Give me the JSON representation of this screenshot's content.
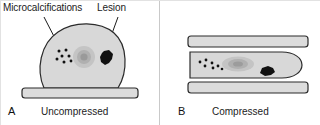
{
  "figure": {
    "width": 320,
    "height": 125,
    "background": "#ffffff"
  },
  "annotations": {
    "microcalcifications_label": "Microcalcifications",
    "lesion_label": "Lesion"
  },
  "panels": [
    {
      "letter": "A",
      "caption": "Uncompressed",
      "features": {
        "breast_outline": "dome",
        "plate_count": 1,
        "microcalcification_count": 7,
        "has_central_nodule": true,
        "has_lesion": true
      }
    },
    {
      "letter": "B",
      "caption": "Compressed",
      "features": {
        "breast_outline": "flattened-oval",
        "plate_count": 2,
        "microcalcification_count": 7,
        "has_central_nodule": true,
        "has_lesion": true
      }
    }
  ],
  "colors": {
    "tissue_fill": "#d8d8d8",
    "tissue_stroke": "#2b2b2b",
    "nodule_outer": "#b6b6b6",
    "nodule_inner": "#9a9a9a",
    "lesion_fill": "#111111",
    "plate_fill": "#dcdcdc",
    "plate_stroke": "#2b2b2b",
    "leader_line": "#1b1b1b",
    "text": "#1b1b1b",
    "divider": "#c9c9c9"
  }
}
